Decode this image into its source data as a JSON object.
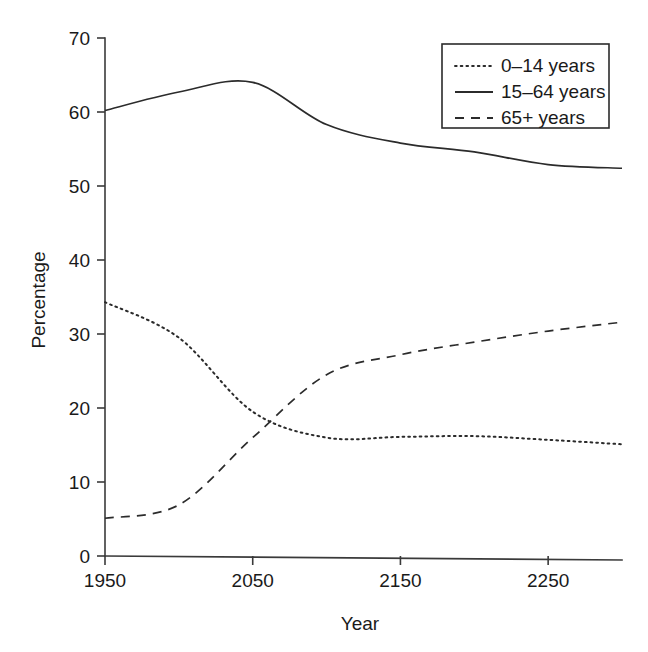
{
  "chart_data": {
    "type": "line",
    "title": "",
    "xlabel": "Year",
    "ylabel": "Percentage",
    "xlim": [
      1950,
      2300
    ],
    "ylim": [
      0,
      70
    ],
    "xticks": [
      1950,
      2050,
      2150,
      2250
    ],
    "yticks": [
      0,
      10,
      20,
      30,
      40,
      50,
      60,
      70
    ],
    "xtick_labels": [
      "1950",
      "2050",
      "2150",
      "2250"
    ],
    "ytick_labels": [
      "0",
      "10",
      "20",
      "30",
      "40",
      "50",
      "60",
      "70"
    ],
    "grid": false,
    "legend_position": "top-right",
    "legend_entries": [
      "0–14 years",
      "15–64 years",
      "65+ years"
    ],
    "x": [
      1950,
      2000,
      2050,
      2100,
      2150,
      2200,
      2250,
      2300
    ],
    "series": [
      {
        "name": "0–14 years",
        "style": "dotted",
        "values": [
          34.3,
          29.5,
          19.5,
          16.0,
          16.1,
          16.2,
          15.7,
          15.1
        ]
      },
      {
        "name": "15–64 years",
        "style": "solid",
        "values": [
          60.2,
          62.7,
          64.0,
          58.3,
          55.8,
          54.6,
          52.9,
          52.4
        ]
      },
      {
        "name": "65+ years",
        "style": "dashed",
        "values": [
          5.1,
          6.9,
          16.0,
          24.5,
          27.2,
          28.9,
          30.4,
          31.6
        ]
      }
    ],
    "annotations": []
  },
  "colors": {
    "axis": "#3a3a3a",
    "line": "#2b2b2b",
    "text": "#1a1a1a",
    "background": "#ffffff"
  }
}
